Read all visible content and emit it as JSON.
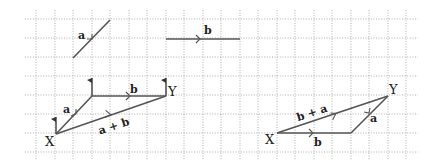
{
  "diagram": {
    "grid": {
      "x0": 25,
      "x1": 418,
      "y0": 19,
      "y1": 153,
      "spacing_x": 18.5,
      "spacing_y": 19
    },
    "vectors": {
      "a": {
        "label": "a",
        "from": [
          73,
          57
        ],
        "to": [
          110,
          19
        ]
      },
      "b": {
        "label": "b",
        "from": [
          166,
          38
        ],
        "to": [
          240,
          38
        ]
      }
    },
    "left_figure": {
      "start_label": "X",
      "end_label": "Y",
      "a_label": "a",
      "b_label": "b",
      "sum_label": "a + b"
    },
    "right_figure": {
      "start_label": "X",
      "end_label": "Y",
      "a_label": "a",
      "b_label": "b",
      "sum_label": "b + a"
    },
    "colors": {
      "line": "#555555",
      "grid": "#9a9a9a",
      "text": "#222222"
    }
  }
}
